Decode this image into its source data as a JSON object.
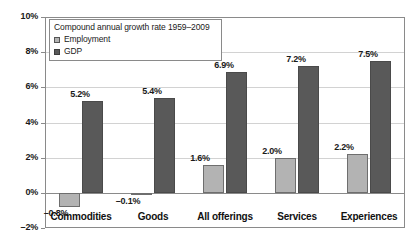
{
  "chart_data": {
    "type": "bar",
    "title": "",
    "xlabel": "",
    "ylabel": "",
    "ylim": [
      -2,
      10
    ],
    "ytick_labels": [
      "10%",
      "8%",
      "6%",
      "4%",
      "2%",
      "0%",
      "–2%"
    ],
    "ytick_values": [
      10,
      8,
      6,
      4,
      2,
      0,
      -2
    ],
    "grid": true,
    "legend_position": "top-left-inside",
    "legend_title": "Compound annual growth rate 1959–2009",
    "categories": [
      "Commodities",
      "Goods",
      "All offerings",
      "Services",
      "Experiences"
    ],
    "series": [
      {
        "name": "Employment",
        "color": "#b3b3b3",
        "values": [
          -0.8,
          -0.1,
          1.6,
          2.0,
          2.2
        ],
        "labels": [
          "–0.8%",
          "–0.1%",
          "1.6%",
          "2.0%",
          "2.2%"
        ]
      },
      {
        "name": "GDP",
        "color": "#595959",
        "values": [
          5.2,
          5.4,
          6.9,
          7.2,
          7.5
        ],
        "labels": [
          "5.2%",
          "5.4%",
          "6.9%",
          "7.2%",
          "7.5%"
        ]
      }
    ]
  },
  "legend": {
    "title": "Compound annual growth rate 1959–2009",
    "items": [
      {
        "label": "Employment",
        "swatch": "employment-swatch"
      },
      {
        "label": "GDP",
        "swatch": "gdp-swatch"
      }
    ]
  }
}
